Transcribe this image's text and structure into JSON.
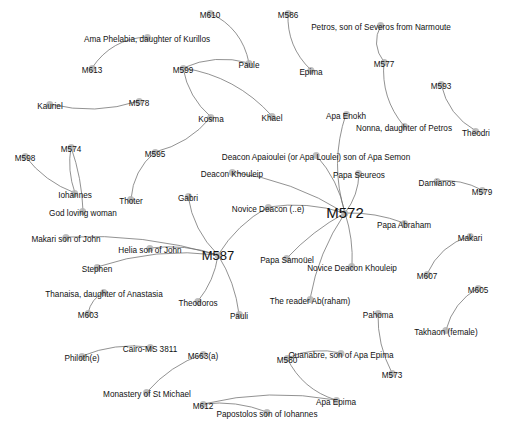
{
  "graph": {
    "title": "Coptic manuscript–person network",
    "background_color": "#ffffff",
    "node_color": "#b3b3b3",
    "edge_color": "#6e6e6e",
    "label_color": "#111111",
    "width": 507,
    "height": 431,
    "node_count": 56,
    "edge_count": 42,
    "nodes": [
      {
        "id": "M613",
        "label": "M613",
        "x": 92,
        "y": 68,
        "size": "normal"
      },
      {
        "id": "AmaPhelabia",
        "label": "Ama Phelabia, daughter of Kurillos",
        "x": 147,
        "y": 37,
        "size": "normal"
      },
      {
        "id": "M610",
        "label": "M610",
        "x": 210,
        "y": 13,
        "size": "normal"
      },
      {
        "id": "Paule",
        "label": "Paule",
        "x": 249,
        "y": 63,
        "size": "normal"
      },
      {
        "id": "M586",
        "label": "M586",
        "x": 288,
        "y": 13,
        "size": "normal"
      },
      {
        "id": "Epima",
        "label": "Epima",
        "x": 311,
        "y": 70,
        "size": "normal"
      },
      {
        "id": "PetrosSeveros",
        "label": "Petros, son of Severos from Narmoute",
        "x": 381,
        "y": 25,
        "size": "normal"
      },
      {
        "id": "M577",
        "label": "M577",
        "x": 384,
        "y": 62,
        "size": "normal"
      },
      {
        "id": "M593",
        "label": "M593",
        "x": 441,
        "y": 84,
        "size": "normal"
      },
      {
        "id": "Theodri",
        "label": "Theodri",
        "x": 476,
        "y": 131,
        "size": "normal"
      },
      {
        "id": "M599",
        "label": "M599",
        "x": 183,
        "y": 68,
        "size": "normal"
      },
      {
        "id": "Kosma",
        "label": "Kosma",
        "x": 211,
        "y": 117,
        "size": "normal"
      },
      {
        "id": "Khael",
        "label": "Khael",
        "x": 272,
        "y": 116,
        "size": "normal"
      },
      {
        "id": "ApaEnokh",
        "label": "Apa Enokh",
        "x": 346,
        "y": 114,
        "size": "normal"
      },
      {
        "id": "Nonna",
        "label": "Nonna, daughter of Petros",
        "x": 404,
        "y": 126,
        "size": "normal"
      },
      {
        "id": "Kauriel",
        "label": "Kauriel",
        "x": 50,
        "y": 104,
        "size": "normal"
      },
      {
        "id": "M578",
        "label": "M578",
        "x": 139,
        "y": 101,
        "size": "normal"
      },
      {
        "id": "M598",
        "label": "M598",
        "x": 25,
        "y": 156,
        "size": "normal"
      },
      {
        "id": "M574",
        "label": "M574",
        "x": 71,
        "y": 147,
        "size": "normal"
      },
      {
        "id": "M595",
        "label": "M595",
        "x": 155,
        "y": 152,
        "size": "normal"
      },
      {
        "id": "Iohannes",
        "label": "Iohannes",
        "x": 75,
        "y": 193,
        "size": "normal"
      },
      {
        "id": "GodLovingWoman",
        "label": "God loving woman",
        "x": 83,
        "y": 211,
        "size": "normal"
      },
      {
        "id": "Thoter",
        "label": "Thoter",
        "x": 131,
        "y": 199,
        "size": "normal"
      },
      {
        "id": "Gabri",
        "label": "Gabri",
        "x": 188,
        "y": 196,
        "size": "normal"
      },
      {
        "id": "DeaconApaioulei",
        "label": "Deacon Apaioulei (or Apa Loulei) son of Apa Semon",
        "x": 316,
        "y": 155,
        "size": "normal"
      },
      {
        "id": "DeaconKhouleip",
        "label": "Deacon Khouleip",
        "x": 232,
        "y": 172,
        "size": "normal"
      },
      {
        "id": "PapaSeureos",
        "label": "Papa Seureos",
        "x": 359,
        "y": 173,
        "size": "normal"
      },
      {
        "id": "Damianos",
        "label": "Damianos",
        "x": 437,
        "y": 181,
        "size": "normal"
      },
      {
        "id": "M579",
        "label": "M579",
        "x": 482,
        "y": 190,
        "size": "normal"
      },
      {
        "id": "NoviceDeaconE",
        "label": "Novice Deacon (..e)",
        "x": 268,
        "y": 207,
        "size": "normal"
      },
      {
        "id": "M572",
        "label": "M572",
        "x": 345,
        "y": 213,
        "size": "hub"
      },
      {
        "id": "PapaAbraham",
        "label": "Papa Abraham",
        "x": 404,
        "y": 223,
        "size": "normal"
      },
      {
        "id": "Makari",
        "label": "Makari",
        "x": 470,
        "y": 236,
        "size": "normal"
      },
      {
        "id": "M607",
        "label": "M607",
        "x": 427,
        "y": 274,
        "size": "normal"
      },
      {
        "id": "M605",
        "label": "M605",
        "x": 478,
        "y": 288,
        "size": "normal"
      },
      {
        "id": "TakhaonFemale",
        "label": "Takhaon (female)",
        "x": 446,
        "y": 330,
        "size": "normal"
      },
      {
        "id": "MakariSonOfJohn",
        "label": "Makari son of John",
        "x": 66,
        "y": 237,
        "size": "normal"
      },
      {
        "id": "HeliaSonOfJohn",
        "label": "Helia son of John",
        "x": 150,
        "y": 248,
        "size": "normal"
      },
      {
        "id": "Stephen",
        "label": "Stephen",
        "x": 97,
        "y": 267,
        "size": "normal"
      },
      {
        "id": "M587",
        "label": "M587",
        "x": 218,
        "y": 255,
        "size": "hub2"
      },
      {
        "id": "PapaSamouel",
        "label": "Papa Samoüel",
        "x": 287,
        "y": 258,
        "size": "normal"
      },
      {
        "id": "NoviceDeaconKhouleip",
        "label": "Novice Deacon Khouleip",
        "x": 352,
        "y": 266,
        "size": "normal"
      },
      {
        "id": "Thanaisa",
        "label": "Thanaisa, daughter of Anastasia",
        "x": 104,
        "y": 292,
        "size": "normal"
      },
      {
        "id": "Theodoros",
        "label": "Theodoros",
        "x": 198,
        "y": 301,
        "size": "normal"
      },
      {
        "id": "Pauli",
        "label": "Pauli",
        "x": 239,
        "y": 314,
        "size": "normal"
      },
      {
        "id": "M603",
        "label": "M603",
        "x": 88,
        "y": 313,
        "size": "normal"
      },
      {
        "id": "TheReaderAbraham",
        "label": "The reader Ab(raham)",
        "x": 310,
        "y": 299,
        "size": "normal"
      },
      {
        "id": "Pahoma",
        "label": "Pahoma",
        "x": 378,
        "y": 313,
        "size": "normal"
      },
      {
        "id": "M573",
        "label": "M573",
        "x": 392,
        "y": 373,
        "size": "normal"
      },
      {
        "id": "M580",
        "label": "M580",
        "x": 287,
        "y": 358,
        "size": "normal"
      },
      {
        "id": "Ouanabre",
        "label": "Ouanabre, son of Apa Epima",
        "x": 341,
        "y": 353,
        "size": "normal"
      },
      {
        "id": "ApaEpima",
        "label": "Apa Epima",
        "x": 336,
        "y": 400,
        "size": "normal"
      },
      {
        "id": "CairoMS3811",
        "label": "Cairo-MS 3811",
        "x": 150,
        "y": 347,
        "size": "normal"
      },
      {
        "id": "Philothe",
        "label": "Philoth(e)",
        "x": 82,
        "y": 356,
        "size": "normal"
      },
      {
        "id": "M663a",
        "label": "M663(a)",
        "x": 203,
        "y": 354,
        "size": "normal"
      },
      {
        "id": "MonasteryStMichael",
        "label": "Monastery of St Michael",
        "x": 147,
        "y": 392,
        "size": "normal"
      },
      {
        "id": "M612",
        "label": "M612",
        "x": 203,
        "y": 404,
        "size": "normal"
      },
      {
        "id": "Papostolos",
        "label": "Papostolos son of Iohannes",
        "x": 267,
        "y": 412,
        "size": "normal"
      }
    ],
    "edges": [
      {
        "source": "M613",
        "target": "AmaPhelabia",
        "curve": -16
      },
      {
        "source": "M610",
        "target": "Paule",
        "curve": -16
      },
      {
        "source": "M586",
        "target": "Epima",
        "curve": 14
      },
      {
        "source": "PetrosSeveros",
        "target": "M577",
        "curve": 12
      },
      {
        "source": "M577",
        "target": "Nonna",
        "curve": 14
      },
      {
        "source": "M593",
        "target": "Theodri",
        "curve": 13
      },
      {
        "source": "M599",
        "target": "Kosma",
        "curve": 10
      },
      {
        "source": "M599",
        "target": "Khael",
        "curve": -18
      },
      {
        "source": "M599",
        "target": "Paule",
        "curve": -12
      },
      {
        "source": "Kauriel",
        "target": "M578",
        "curve": 13
      },
      {
        "source": "M598",
        "target": "Iohannes",
        "curve": 9
      },
      {
        "source": "M574",
        "target": "Iohannes",
        "curve": 6
      },
      {
        "source": "M574",
        "target": "GodLovingWoman",
        "curve": -5
      },
      {
        "source": "M595",
        "target": "Thoter",
        "curve": 11
      },
      {
        "source": "M595",
        "target": "Kosma",
        "curve": 11
      },
      {
        "source": "Gabri",
        "target": "M587",
        "curve": 11
      },
      {
        "source": "Damianos",
        "target": "M579",
        "curve": -7
      },
      {
        "source": "M572",
        "target": "DeaconApaioulei",
        "curve": 9
      },
      {
        "source": "M572",
        "target": "DeaconKhouleip",
        "curve": 13
      },
      {
        "source": "M572",
        "target": "NoviceDeaconE",
        "curve": 9
      },
      {
        "source": "M572",
        "target": "PapaSeureos",
        "curve": 7
      },
      {
        "source": "M572",
        "target": "ApaEnokh",
        "curve": -16
      },
      {
        "source": "M572",
        "target": "PapaAbraham",
        "curve": -6
      },
      {
        "source": "M572",
        "target": "PapaSamouel",
        "curve": 6
      },
      {
        "source": "M572",
        "target": "NoviceDeaconKhouleip",
        "curve": -5
      },
      {
        "source": "M572",
        "target": "TheReaderAbraham",
        "curve": 10
      },
      {
        "source": "M587",
        "target": "MakariSonOfJohn",
        "curve": 13
      },
      {
        "source": "M587",
        "target": "HeliaSonOfJohn",
        "curve": 8
      },
      {
        "source": "M587",
        "target": "Stephen",
        "curve": 14
      },
      {
        "source": "M587",
        "target": "Theodoros",
        "curve": -7
      },
      {
        "source": "M587",
        "target": "Pauli",
        "curve": -7
      },
      {
        "source": "M587",
        "target": "NoviceDeaconE",
        "curve": -9
      },
      {
        "source": "M603",
        "target": "Thanaisa",
        "curve": -6
      },
      {
        "source": "M607",
        "target": "Makari",
        "curve": -13
      },
      {
        "source": "M605",
        "target": "TakhaonFemale",
        "curve": 11
      },
      {
        "source": "Pahoma",
        "target": "M573",
        "curve": 8
      },
      {
        "source": "M580",
        "target": "Ouanabre",
        "curve": -9
      },
      {
        "source": "M580",
        "target": "ApaEpima",
        "curve": 14
      },
      {
        "source": "CairoMS3811",
        "target": "Philothe",
        "curve": 9
      },
      {
        "source": "M663a",
        "target": "MonasteryStMichael",
        "curve": 9
      },
      {
        "source": "M612",
        "target": "Papostolos",
        "curve": -8
      },
      {
        "source": "M612",
        "target": "ApaEpima",
        "curve": -14
      }
    ]
  }
}
